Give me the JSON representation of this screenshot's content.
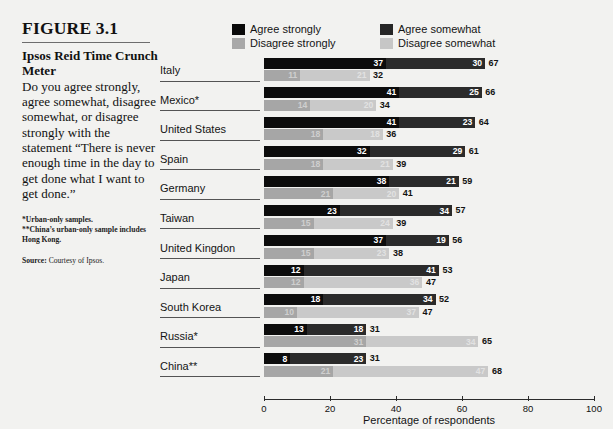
{
  "figure": {
    "number": "FIGURE 3.1",
    "title": "Ipsos Reid Time Crunch Meter",
    "body": "Do you agree strongly, agree somewhat, disagree somewhat, or disagree strongly with the statement “There is never enough time in the day to get done what I want to get done.”",
    "footnote1": "*Urban-only samples.",
    "footnote2": "**China’s urban-only sample includes Hong Kong.",
    "source_label": "Source:",
    "source_text": "Courtesy of Ipsos."
  },
  "legend": {
    "items": [
      {
        "label": "Agree strongly",
        "color": "#0a0a0a",
        "key": "agree_strongly"
      },
      {
        "label": "Agree somewhat",
        "color": "#262626",
        "key": "agree_somewhat"
      },
      {
        "label": "Disagree strongly",
        "color": "#a8a8a8",
        "key": "disagree_strongly"
      },
      {
        "label": "Disagree somewhat",
        "color": "#c6c6c6",
        "key": "disagree_somewhat"
      }
    ]
  },
  "chart_data": {
    "type": "bar",
    "orientation": "horizontal",
    "stacked": true,
    "title": "Ipsos Reid Time Crunch Meter",
    "xlabel": "Percentage of respondents",
    "ylabel": "",
    "xlim": [
      0,
      100
    ],
    "xticks": [
      0,
      20,
      40,
      60,
      80,
      100
    ],
    "xtick_labels": [
      "0",
      "20",
      "40",
      "60",
      "80",
      "100"
    ],
    "grid": false,
    "legend_position": "top",
    "categories": [
      "Italy",
      "Mexico*",
      "United States",
      "Spain",
      "Germany",
      "Taiwan",
      "United Kingdon",
      "Japan",
      "South Korea",
      "Russia*",
      "China**"
    ],
    "series": [
      {
        "name": "Agree strongly",
        "color": "#0c0c0c",
        "values": [
          37,
          41,
          41,
          32,
          38,
          23,
          37,
          12,
          18,
          13,
          8
        ]
      },
      {
        "name": "Agree somewhat",
        "color": "#2b2b2b",
        "values": [
          30,
          25,
          23,
          29,
          21,
          34,
          19,
          41,
          34,
          18,
          23
        ]
      },
      {
        "name": "Disagree strongly",
        "color": "#a6a6a6",
        "values": [
          11,
          14,
          18,
          18,
          21,
          15,
          15,
          12,
          10,
          31,
          21
        ]
      },
      {
        "name": "Disagree somewhat",
        "color": "#c9c9c9",
        "values": [
          21,
          20,
          18,
          21,
          20,
          24,
          23,
          36,
          37,
          34,
          47
        ]
      }
    ],
    "agree_totals": [
      67,
      66,
      64,
      61,
      59,
      57,
      56,
      53,
      52,
      31,
      31
    ],
    "disagree_totals": [
      32,
      34,
      36,
      39,
      41,
      39,
      38,
      47,
      47,
      65,
      68
    ]
  }
}
